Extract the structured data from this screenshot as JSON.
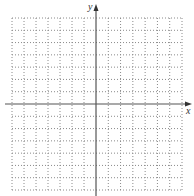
{
  "diagram": {
    "type": "coordinate-plane",
    "axes": {
      "x_label": "x",
      "y_label": "y",
      "axis_color": "#555555"
    },
    "grid": {
      "columns": 14,
      "rows": 14,
      "columns_left_of_y_axis": 7,
      "columns_right_of_y_axis": 7,
      "rows_above_x_axis": 7,
      "rows_below_x_axis": 7,
      "line_style": "dotted",
      "line_color": "#8a8a8a"
    }
  }
}
